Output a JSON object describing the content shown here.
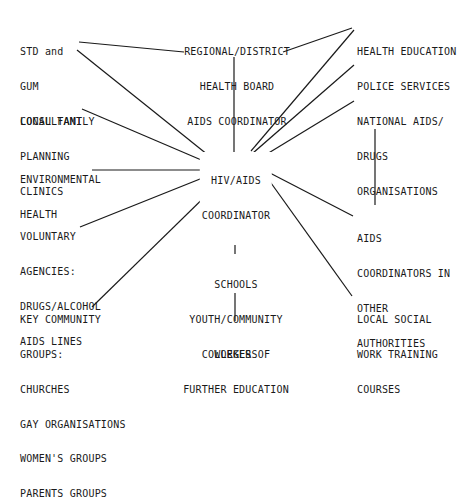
{
  "diagram": {
    "type": "hub-and-spoke network",
    "line_color": "#1a1a1a",
    "background": "#ffffff",
    "center_node": {
      "id": "hiv_aids_coordinator",
      "lines": [
        "HIV/AIDS",
        "COORDINATOR"
      ]
    },
    "nodes": {
      "std": {
        "lines": [
          "STD and",
          "GUM",
          "CONSULTANT"
        ]
      },
      "regional": {
        "lines": [
          "REGIONAL/DISTRICT",
          "HEALTH BOARD",
          "AIDS COORDINATOR"
        ]
      },
      "health_education": {
        "lines": [
          "HEALTH EDUCATION"
        ]
      },
      "police": {
        "lines": [
          "POLICE SERVICES"
        ]
      },
      "national": {
        "lines": [
          "NATIONAL AIDS/",
          "DRUGS",
          "ORGANISATIONS"
        ]
      },
      "family_planning": {
        "lines": [
          "LOCAL FAMILY",
          "PLANNING",
          "CLINICS"
        ]
      },
      "environmental": {
        "lines": [
          "ENVIRONMENTAL",
          "HEALTH"
        ]
      },
      "voluntary": {
        "lines": [
          "VOLUNTARY",
          "AGENCIES:",
          "DRUGS/ALCOHOL",
          "AIDS LINES"
        ]
      },
      "other_coordinators": {
        "lines": [
          "AIDS",
          "COORDINATORS IN",
          "OTHER",
          "AUTHORITIES"
        ]
      },
      "schools": {
        "lines": [
          "SCHOOLS",
          "YOUTH/COMMUNITY",
          "WORKERS"
        ]
      },
      "key_community": {
        "lines": [
          "KEY COMMUNITY",
          "GROUPS:",
          "CHURCHES",
          "GAY ORGANISATIONS",
          "WOMEN'S GROUPS",
          "PARENTS GROUPS"
        ]
      },
      "social_work": {
        "lines": [
          "LOCAL SOCIAL",
          "WORK TRAINING",
          "COURSES"
        ]
      },
      "colleges": {
        "lines": [
          "COLLEGES OF",
          "FURTHER EDUCATION"
        ]
      }
    },
    "edges": [
      [
        "hiv_aids_coordinator",
        "std"
      ],
      [
        "hiv_aids_coordinator",
        "regional"
      ],
      [
        "hiv_aids_coordinator",
        "health_education"
      ],
      [
        "hiv_aids_coordinator",
        "police"
      ],
      [
        "hiv_aids_coordinator",
        "national"
      ],
      [
        "hiv_aids_coordinator",
        "family_planning"
      ],
      [
        "hiv_aids_coordinator",
        "environmental"
      ],
      [
        "hiv_aids_coordinator",
        "voluntary"
      ],
      [
        "hiv_aids_coordinator",
        "other_coordinators"
      ],
      [
        "hiv_aids_coordinator",
        "schools"
      ],
      [
        "hiv_aids_coordinator",
        "key_community"
      ],
      [
        "hiv_aids_coordinator",
        "social_work"
      ],
      [
        "regional",
        "std"
      ],
      [
        "regional",
        "health_education"
      ],
      [
        "national",
        "other_coordinators"
      ],
      [
        "schools",
        "colleges"
      ]
    ]
  }
}
